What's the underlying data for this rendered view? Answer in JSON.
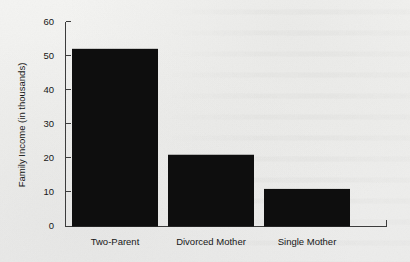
{
  "chart_data": {
    "type": "bar",
    "title": "",
    "subtitle": "",
    "xlabel": "",
    "ylabel": "Family Income (in thousands)",
    "categories": [
      "Two-Parent",
      "Divorced Mother",
      "Single Mother"
    ],
    "values": [
      52,
      21,
      11
    ],
    "ylim": [
      0,
      60
    ],
    "yticks": [
      0,
      10,
      20,
      30,
      40,
      50,
      60
    ],
    "ytick_labels": [
      "0",
      "10",
      "20",
      "30",
      "40",
      "50",
      "60"
    ],
    "grid": false,
    "legend": null,
    "legend_position": "none",
    "annotations": [],
    "bar_color": "#0e0e0e",
    "axis_color": "#3c3c3c",
    "background_color": "#f0f0ee"
  }
}
